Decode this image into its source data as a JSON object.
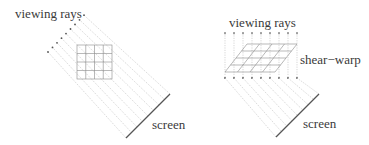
{
  "panels": [
    {
      "id": "left",
      "name": "standard-ray-casting",
      "labels": {
        "rays": "viewing rays",
        "screen": "screen"
      },
      "ray_count": 9,
      "grid": {
        "rows": 4,
        "cols": 4
      }
    },
    {
      "id": "right",
      "name": "shear-warp",
      "labels": {
        "rays": "viewing rays",
        "method": "shear−warp",
        "screen": "screen"
      },
      "ray_count": 9,
      "grid": {
        "rows": 4,
        "cols": 4
      }
    }
  ],
  "colors": {
    "ray": "#b8b8b8",
    "grid": "#8a8a8a",
    "screen": "#555555",
    "text": "#3a3a3a",
    "arrow": "#555555"
  }
}
